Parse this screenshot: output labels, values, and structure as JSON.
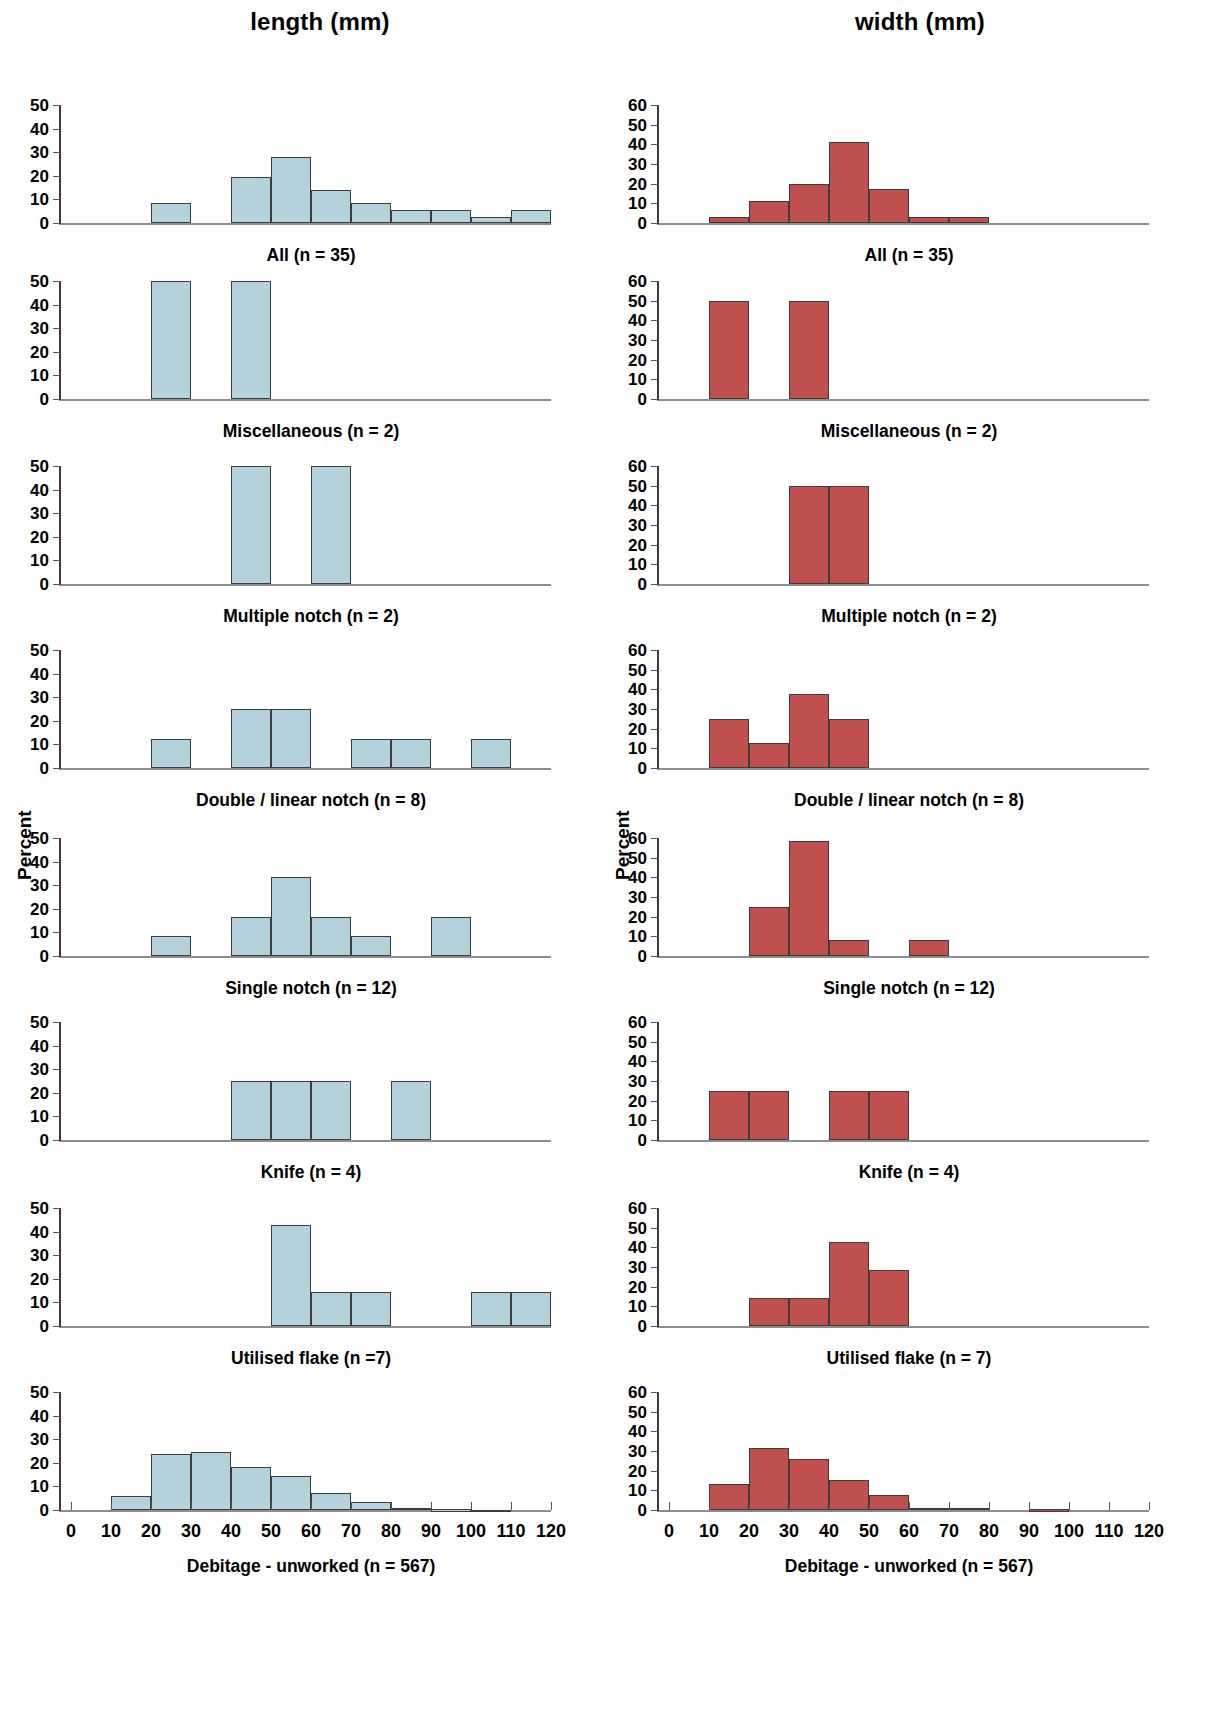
{
  "figure": {
    "column_titles": {
      "left": "length (mm)",
      "right": "width (mm)"
    },
    "y_axis_title": "Percent",
    "left_color": "#b3d2dc",
    "right_color": "#c0504d"
  },
  "chart_data": [
    {
      "id": "length-all",
      "type": "bar",
      "title": "length (mm)",
      "caption": "All (n = 35)",
      "xlabel": "length (mm)",
      "ylabel": "Percent",
      "color": "#b3d2dc",
      "xlim": [
        0,
        120
      ],
      "ylim": [
        0,
        50
      ],
      "yticks": [
        0,
        10,
        20,
        30,
        40,
        50
      ],
      "xticks": [
        0,
        10,
        20,
        30,
        40,
        50,
        60,
        70,
        80,
        90,
        100,
        110,
        120
      ],
      "bin_width": 10,
      "bins": [
        20,
        30,
        40,
        50,
        60,
        70,
        80,
        90,
        100,
        110
      ],
      "values": [
        8.6,
        0,
        19.6,
        28,
        14,
        8.6,
        5.3,
        5.3,
        2.7,
        5.3
      ]
    },
    {
      "id": "length-miscellaneous",
      "type": "bar",
      "title": "length (mm)",
      "caption": "Miscellaneous (n = 2)",
      "xlabel": "length (mm)",
      "ylabel": "Percent",
      "color": "#b3d2dc",
      "xlim": [
        0,
        120
      ],
      "ylim": [
        0,
        50
      ],
      "yticks": [
        0,
        10,
        20,
        30,
        40,
        50
      ],
      "xticks": [
        0,
        10,
        20,
        30,
        40,
        50,
        60,
        70,
        80,
        90,
        100,
        110,
        120
      ],
      "bin_width": 10,
      "bins": [
        20,
        40
      ],
      "values": [
        50,
        50
      ]
    },
    {
      "id": "length-multiple-notch",
      "type": "bar",
      "title": "length (mm)",
      "caption": "Multiple notch (n = 2)",
      "xlabel": "length (mm)",
      "ylabel": "Percent",
      "color": "#b3d2dc",
      "xlim": [
        0,
        120
      ],
      "ylim": [
        0,
        50
      ],
      "yticks": [
        0,
        10,
        20,
        30,
        40,
        50
      ],
      "xticks": [
        0,
        10,
        20,
        30,
        40,
        50,
        60,
        70,
        80,
        90,
        100,
        110,
        120
      ],
      "bin_width": 10,
      "bins": [
        40,
        60
      ],
      "values": [
        50,
        50
      ]
    },
    {
      "id": "length-double-linear-notch",
      "type": "bar",
      "title": "length (mm)",
      "caption": "Double / linear notch (n = 8)",
      "xlabel": "length (mm)",
      "ylabel": "Percent",
      "color": "#b3d2dc",
      "xlim": [
        0,
        120
      ],
      "ylim": [
        0,
        50
      ],
      "yticks": [
        0,
        10,
        20,
        30,
        40,
        50
      ],
      "xticks": [
        0,
        10,
        20,
        30,
        40,
        50,
        60,
        70,
        80,
        90,
        100,
        110,
        120
      ],
      "bin_width": 10,
      "bins": [
        20,
        40,
        50,
        70,
        80,
        100
      ],
      "values": [
        12.5,
        25,
        25,
        12.5,
        12.5,
        12.5
      ]
    },
    {
      "id": "length-single-notch",
      "type": "bar",
      "title": "length (mm)",
      "caption": "Single notch (n = 12)",
      "xlabel": "length (mm)",
      "ylabel": "Percent",
      "color": "#b3d2dc",
      "xlim": [
        0,
        120
      ],
      "ylim": [
        0,
        50
      ],
      "yticks": [
        0,
        10,
        20,
        30,
        40,
        50
      ],
      "xticks": [
        0,
        10,
        20,
        30,
        40,
        50,
        60,
        70,
        80,
        90,
        100,
        110,
        120
      ],
      "bin_width": 10,
      "bins": [
        20,
        40,
        50,
        60,
        70,
        90
      ],
      "values": [
        8.3,
        16.7,
        33.3,
        16.7,
        8.3,
        16.7
      ]
    },
    {
      "id": "length-knife",
      "type": "bar",
      "title": "length (mm)",
      "caption": "Knife (n = 4)",
      "xlabel": "length (mm)",
      "ylabel": "Percent",
      "color": "#b3d2dc",
      "xlim": [
        0,
        120
      ],
      "ylim": [
        0,
        50
      ],
      "yticks": [
        0,
        10,
        20,
        30,
        40,
        50
      ],
      "xticks": [
        0,
        10,
        20,
        30,
        40,
        50,
        60,
        70,
        80,
        90,
        100,
        110,
        120
      ],
      "bin_width": 10,
      "bins": [
        40,
        50,
        60,
        80
      ],
      "values": [
        25,
        25,
        25,
        25
      ]
    },
    {
      "id": "length-utilised-flake",
      "type": "bar",
      "title": "length (mm)",
      "caption": "Utilised flake (n =7)",
      "xlabel": "length (mm)",
      "ylabel": "Percent",
      "color": "#b3d2dc",
      "xlim": [
        0,
        120
      ],
      "ylim": [
        0,
        50
      ],
      "yticks": [
        0,
        10,
        20,
        30,
        40,
        50
      ],
      "xticks": [
        0,
        10,
        20,
        30,
        40,
        50,
        60,
        70,
        80,
        90,
        100,
        110,
        120
      ],
      "bin_width": 10,
      "bins": [
        50,
        60,
        70,
        100,
        110
      ],
      "values": [
        42.9,
        14.3,
        14.3,
        14.3,
        14.3
      ]
    },
    {
      "id": "length-debitage-unworked",
      "type": "bar",
      "title": "length (mm)",
      "caption": "Debitage - unworked (n = 567)",
      "xlabel": "length (mm)",
      "ylabel": "Percent",
      "color": "#b3d2dc",
      "xlim": [
        0,
        120
      ],
      "ylim": [
        0,
        50
      ],
      "yticks": [
        0,
        10,
        20,
        30,
        40,
        50
      ],
      "xticks": [
        0,
        10,
        20,
        30,
        40,
        50,
        60,
        70,
        80,
        90,
        100,
        110,
        120
      ],
      "bin_width": 10,
      "bins": [
        10,
        20,
        30,
        40,
        50,
        60,
        70,
        80,
        90,
        100
      ],
      "values": [
        5.8,
        23.6,
        24.4,
        18.1,
        14.3,
        7.1,
        3.2,
        1,
        0.3,
        0.2
      ]
    },
    {
      "id": "width-all",
      "type": "bar",
      "title": "width (mm)",
      "caption": "All (n = 35)",
      "xlabel": "width (mm)",
      "ylabel": "Percent",
      "color": "#c0504d",
      "xlim": [
        0,
        120
      ],
      "ylim": [
        0,
        60
      ],
      "yticks": [
        0,
        10,
        20,
        30,
        40,
        50,
        60
      ],
      "xticks": [
        0,
        10,
        20,
        30,
        40,
        50,
        60,
        70,
        80,
        90,
        100,
        110,
        120
      ],
      "bin_width": 10,
      "bins": [
        10,
        20,
        30,
        40,
        50,
        60,
        70
      ],
      "values": [
        2.8,
        11.4,
        20,
        41.4,
        17.1,
        2.8,
        2.8
      ]
    },
    {
      "id": "width-miscellaneous",
      "type": "bar",
      "title": "width (mm)",
      "caption": "Miscellaneous (n = 2)",
      "xlabel": "width (mm)",
      "ylabel": "Percent",
      "color": "#c0504d",
      "xlim": [
        0,
        120
      ],
      "ylim": [
        0,
        60
      ],
      "yticks": [
        0,
        10,
        20,
        30,
        40,
        50,
        60
      ],
      "xticks": [
        0,
        10,
        20,
        30,
        40,
        50,
        60,
        70,
        80,
        90,
        100,
        110,
        120
      ],
      "bin_width": 10,
      "bins": [
        10,
        30
      ],
      "values": [
        50,
        50
      ]
    },
    {
      "id": "width-multiple-notch",
      "type": "bar",
      "title": "width (mm)",
      "caption": "Multiple notch (n = 2)",
      "xlabel": "width (mm)",
      "ylabel": "Percent",
      "color": "#c0504d",
      "xlim": [
        0,
        120
      ],
      "ylim": [
        0,
        60
      ],
      "yticks": [
        0,
        10,
        20,
        30,
        40,
        50,
        60
      ],
      "xticks": [
        0,
        10,
        20,
        30,
        40,
        50,
        60,
        70,
        80,
        90,
        100,
        110,
        120
      ],
      "bin_width": 10,
      "bins": [
        30,
        40
      ],
      "values": [
        50,
        50
      ]
    },
    {
      "id": "width-double-linear-notch",
      "type": "bar",
      "title": "width (mm)",
      "caption": "Double / linear notch (n = 8)",
      "xlabel": "width (mm)",
      "ylabel": "Percent",
      "color": "#c0504d",
      "xlim": [
        0,
        120
      ],
      "ylim": [
        0,
        60
      ],
      "yticks": [
        0,
        10,
        20,
        30,
        40,
        50,
        60
      ],
      "xticks": [
        0,
        10,
        20,
        30,
        40,
        50,
        60,
        70,
        80,
        90,
        100,
        110,
        120
      ],
      "bin_width": 10,
      "bins": [
        10,
        20,
        30,
        40
      ],
      "values": [
        25,
        12.5,
        37.5,
        25
      ]
    },
    {
      "id": "width-single-notch",
      "type": "bar",
      "title": "width (mm)",
      "caption": "Single notch (n = 12)",
      "xlabel": "width (mm)",
      "ylabel": "Percent",
      "color": "#c0504d",
      "xlim": [
        0,
        120
      ],
      "ylim": [
        0,
        60
      ],
      "yticks": [
        0,
        10,
        20,
        30,
        40,
        50,
        60
      ],
      "xticks": [
        0,
        10,
        20,
        30,
        40,
        50,
        60,
        70,
        80,
        90,
        100,
        110,
        120
      ],
      "bin_width": 10,
      "bins": [
        20,
        30,
        40,
        60
      ],
      "values": [
        25,
        58.3,
        8.3,
        8.3
      ]
    },
    {
      "id": "width-knife",
      "type": "bar",
      "title": "width (mm)",
      "caption": "Knife (n = 4)",
      "xlabel": "width (mm)",
      "ylabel": "Percent",
      "color": "#c0504d",
      "xlim": [
        0,
        120
      ],
      "ylim": [
        0,
        60
      ],
      "yticks": [
        0,
        10,
        20,
        30,
        40,
        50,
        60
      ],
      "xticks": [
        0,
        10,
        20,
        30,
        40,
        50,
        60,
        70,
        80,
        90,
        100,
        110,
        120
      ],
      "bin_width": 10,
      "bins": [
        10,
        20,
        40,
        50
      ],
      "values": [
        25,
        25,
        25,
        25
      ]
    },
    {
      "id": "width-utilised-flake",
      "type": "bar",
      "title": "width (mm)",
      "caption": "Utilised flake (n = 7)",
      "xlabel": "width (mm)",
      "ylabel": "Percent",
      "color": "#c0504d",
      "xlim": [
        0,
        120
      ],
      "ylim": [
        0,
        60
      ],
      "yticks": [
        0,
        10,
        20,
        30,
        40,
        50,
        60
      ],
      "xticks": [
        0,
        10,
        20,
        30,
        40,
        50,
        60,
        70,
        80,
        90,
        100,
        110,
        120
      ],
      "bin_width": 10,
      "bins": [
        20,
        30,
        40,
        50
      ],
      "values": [
        14.3,
        14.3,
        42.9,
        28.6
      ]
    },
    {
      "id": "width-debitage-unworked",
      "type": "bar",
      "title": "width (mm)",
      "caption": "Debitage - unworked (n = 567)",
      "xlabel": "width (mm)",
      "ylabel": "Percent",
      "color": "#c0504d",
      "xlim": [
        0,
        120
      ],
      "ylim": [
        0,
        60
      ],
      "yticks": [
        0,
        10,
        20,
        30,
        40,
        50,
        60
      ],
      "xticks": [
        0,
        10,
        20,
        30,
        40,
        50,
        60,
        70,
        80,
        90,
        100,
        110,
        120
      ],
      "bin_width": 10,
      "bins": [
        10,
        20,
        30,
        40,
        50,
        60,
        70,
        90
      ],
      "values": [
        13.1,
        31.4,
        26.1,
        15.2,
        7.6,
        1.1,
        1.1,
        0.3
      ]
    }
  ]
}
